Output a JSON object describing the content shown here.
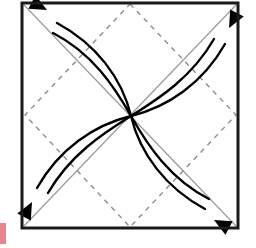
{
  "figure": {
    "title": "Pinwheel rotation diagram",
    "canvas": {
      "width": 256,
      "height": 248,
      "background": "#ffffff"
    },
    "colors": {
      "frame": "#1a1a1a",
      "diamond_dashed": "#8d8d8d",
      "diagonal": "#9a9a9a",
      "curve": "#000000",
      "arrowhead": "#000000",
      "margin_marker": "#e8848f"
    },
    "frame": {
      "label": "square-frame",
      "x": 22,
      "y": 3,
      "width": 216,
      "height": 225,
      "stroke_width": 3
    },
    "center": {
      "label": "center-point",
      "x": 131,
      "y": 116
    },
    "diamond": {
      "label": "inscribed-dashed-diamond",
      "stroke_width": 1.4,
      "dash_pattern": "5 5",
      "vertices": [
        {
          "name": "top",
          "x": 130,
          "y": 4
        },
        {
          "name": "right",
          "x": 236,
          "y": 115
        },
        {
          "name": "bottom",
          "x": 130,
          "y": 227
        },
        {
          "name": "left",
          "x": 25,
          "y": 115
        }
      ]
    },
    "diagonals": [
      {
        "label": "diagonal-tl-br",
        "x1": 24,
        "y1": 5,
        "x2": 236,
        "y2": 226,
        "stroke_width": 1.2
      },
      {
        "label": "diagonal-tr-bl",
        "x1": 236,
        "y1": 5,
        "x2": 24,
        "y2": 226,
        "stroke_width": 1.2
      }
    ],
    "petals": [
      {
        "label": "petal-upper-left",
        "direction": "up-left",
        "outer_curve": "M 131 116 C 122 78 96 44 57 23",
        "inner_curve": "M 131 116 C 114 86 92 53 53 33",
        "arrow": {
          "tip_x": 47,
          "tip_y": 10,
          "angle_deg": 208,
          "size": 17
        }
      },
      {
        "label": "petal-upper-right",
        "direction": "up-right",
        "outer_curve": "M 131 116 C 168 107 203 83 225 44",
        "inner_curve": "M 131 116 C 160 98 192 77 214 39",
        "arrow": {
          "tip_x": 229,
          "tip_y": 28,
          "angle_deg": 298,
          "size": 17
        }
      },
      {
        "label": "petal-lower-right",
        "direction": "down-right",
        "outer_curve": "M 131 116 C 140 154 166 188 205 209",
        "inner_curve": "M 131 116 C 148 146 170 179 209 199",
        "arrow": {
          "tip_x": 214,
          "tip_y": 220,
          "angle_deg": 28,
          "size": 17
        }
      },
      {
        "label": "petal-lower-left",
        "direction": "down-left",
        "outer_curve": "M 131 116 C 94 125 59 149 37 188",
        "inner_curve": "M 131 116 C 102 134 70 155 48 193",
        "arrow": {
          "tip_x": 32,
          "tip_y": 202,
          "angle_deg": 118,
          "size": 17
        }
      }
    ],
    "margin_marker": {
      "label": "page-margin-marker",
      "x": 0,
      "y": 223,
      "width": 6,
      "height": 21
    }
  }
}
